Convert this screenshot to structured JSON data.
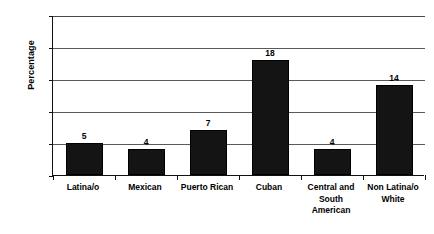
{
  "chart_data": {
    "type": "bar",
    "title": "",
    "xlabel": "",
    "ylabel": "Percentage",
    "ylim": [
      0,
      25
    ],
    "yticks": [
      0,
      5,
      10,
      15,
      20,
      25
    ],
    "grid": true,
    "legend": false,
    "categories": [
      "Latina/o",
      "Mexican",
      "Puerto Rican",
      "Cuban",
      "Central and South American",
      "Non Latina/o White"
    ],
    "category_lines": [
      [
        "Latina/o"
      ],
      [
        "Mexican"
      ],
      [
        "Puerto Rican"
      ],
      [
        "Cuban"
      ],
      [
        "Central and",
        "South",
        "American"
      ],
      [
        "Non Latina/o",
        "White"
      ]
    ],
    "values": [
      5,
      4,
      7,
      18,
      4,
      14
    ],
    "value_labels": [
      "5",
      "4",
      "7",
      "18",
      "4",
      "14"
    ],
    "bar_color": "#141414"
  }
}
